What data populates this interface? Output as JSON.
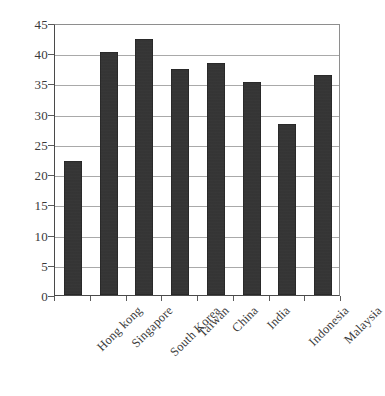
{
  "chart_data": {
    "type": "bar",
    "title": "",
    "subtitle": "",
    "xlabel": "",
    "ylabel": "",
    "categories": [
      "Hong kong",
      "Singapore",
      "South Korea",
      "Taiwan",
      "China",
      "India",
      "Indonesia",
      "Malaysia"
    ],
    "values": [
      22.2,
      40.2,
      42.3,
      37.4,
      38.4,
      35.2,
      28.3,
      36.4
    ],
    "ylim": [
      0,
      45
    ],
    "yticks": [
      0,
      5,
      10,
      15,
      20,
      25,
      30,
      35,
      40,
      45
    ],
    "ytick_labels": [
      "0",
      "5",
      "10",
      "15",
      "20",
      "25",
      "30",
      "35",
      "40",
      "45"
    ],
    "grid": true,
    "grid_axis": "y",
    "legend": false,
    "legend_position": "none",
    "bar_color": "#333333",
    "annotations": []
  },
  "colors": {
    "background": "#ffffff",
    "bar": "#333333",
    "gridline": "#a9a9a9",
    "axis": "#4a4a4a",
    "text": "#3a3a3a"
  }
}
